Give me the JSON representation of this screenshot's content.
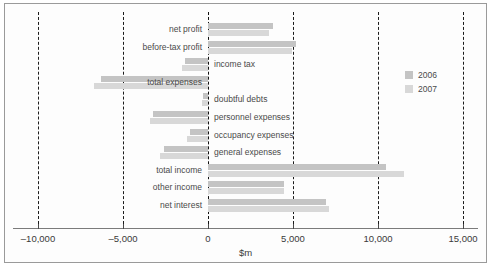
{
  "chart_data": {
    "type": "bar",
    "orientation": "horizontal",
    "title": "",
    "xlabel": "$m",
    "ylabel": "",
    "xlim": [
      -10000,
      15000
    ],
    "xticks": [
      -10000,
      -5000,
      0,
      5000,
      10000,
      15000
    ],
    "xticklabels": [
      "–10,000",
      "–5,000",
      "0",
      "5,000",
      "10,000",
      "15,000"
    ],
    "grid": "vertical-dashed",
    "legend_position": "right",
    "categories": [
      "net profit",
      "before-tax profit",
      "income tax",
      "total expenses",
      "doubtful debts",
      "personnel expenses",
      "occupancy expenses",
      "general expenses",
      "total income",
      "other income",
      "net interest"
    ],
    "series": [
      {
        "name": "2006",
        "color": "#c4c4c4",
        "values": [
          3800,
          5200,
          -1350,
          -6300,
          -300,
          -3250,
          -1050,
          -2600,
          10450,
          4450,
          6950
        ]
      },
      {
        "name": "2007",
        "color": "#d8d8d8",
        "values": [
          3600,
          4950,
          -1550,
          -6700,
          -350,
          -3400,
          -1250,
          -2800,
          11500,
          4450,
          7100
        ]
      }
    ]
  },
  "legend": {
    "items": [
      {
        "label": "2006",
        "color": "#c4c4c4"
      },
      {
        "label": "2007",
        "color": "#d8d8d8"
      }
    ]
  },
  "axis": {
    "units_label": "$m"
  }
}
